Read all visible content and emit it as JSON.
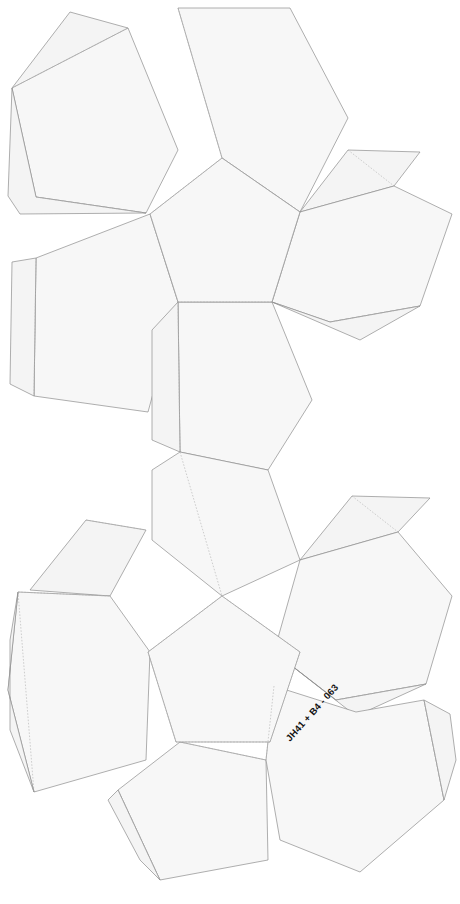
{
  "document": {
    "title": "Dodecahedron papercraft net",
    "background_color": "#ffffff",
    "face_fill_color": "#f7f7f7",
    "tab_fill_color": "#f4f4f4",
    "cut_line_color": "#8d8d8d",
    "fold_line_color": "#b0b0b0",
    "width_px": 460,
    "height_px": 904
  },
  "annotation": {
    "text": "JH41 + B4 - 063",
    "rotation_deg": -48,
    "x": 290,
    "y": 742,
    "color": "#111111"
  },
  "clusters": [
    {
      "id": "upper-cluster",
      "name": "Upper pentagon flower",
      "center_face_label": "",
      "center": {
        "cx": 222,
        "cy": 232
      },
      "petal_count": 5
    },
    {
      "id": "lower-cluster",
      "name": "Lower pentagon flower",
      "center_face_label": "",
      "center": {
        "cx": 222,
        "cy": 670
      },
      "petal_count": 5
    }
  ],
  "geometry": {
    "upper": {
      "center_face": "222,160 297,214 268,302 176,302 147,214",
      "faces": [
        {
          "name": "face-upper-north",
          "points": "222,160 176,302 176,302 222,160"
        },
        {
          "name": "face-upper-top",
          "points": "176,160 176,20 281,20 334,143 297,214 222,160"
        },
        {
          "name": "face-upper-left",
          "points": "147,214 10,88 10,88 147,214"
        }
      ]
    }
  },
  "shapes": {
    "upper": {
      "center": "222,158 299,213 270,303 175,303 146,213",
      "petal_top": "222,158 190,38 262,8 334,68 331,157 299,213",
      "petal_topleft": "146,213 8,93 8,93 76,8 175,34 222,158",
      "petal_left": "175,303 35,390 8,322 8,258 76,258 146,213",
      "petal_right": "299,213 345,148 424,150 452,213 424,303 370,330 270,303",
      "petal_bottom": "175,303 180,432 240,452 270,303"
    }
  },
  "polygons": {
    "upper_center": [
      [
        222,
        158
      ],
      [
        299,
        213
      ],
      [
        270,
        303
      ],
      [
        175,
        303
      ],
      [
        146,
        213
      ]
    ],
    "upper_petal_n": [
      [
        222,
        158
      ],
      [
        299,
        213
      ],
      [
        331,
        160
      ],
      [
        288,
        22
      ],
      [
        176,
        22
      ],
      [
        146,
        213
      ]
    ],
    "lower_center": [
      [
        222,
        596
      ],
      [
        299,
        651
      ],
      [
        270,
        741
      ],
      [
        175,
        741
      ],
      [
        146,
        651
      ]
    ]
  },
  "legend": {
    "solid_line_meaning": "cut line",
    "dashed_line_meaning": "fold line",
    "tab_meaning": "glue tab"
  }
}
